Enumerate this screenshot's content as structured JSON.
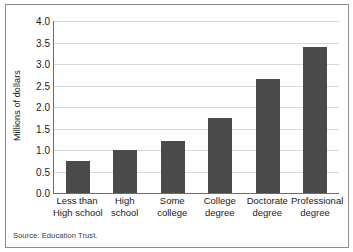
{
  "chart_data": {
    "type": "bar",
    "title": "",
    "xlabel": "",
    "ylabel": "Millions of dollars",
    "ylim": [
      0,
      4.0
    ],
    "ytick_step": 0.5,
    "grid": true,
    "legend": null,
    "categories": [
      "Less than High school",
      "High school",
      "Some college",
      "College degree",
      "Doctorate degree",
      "Professional degree"
    ],
    "category_lines": [
      [
        "Less than",
        "High school"
      ],
      [
        "High",
        "school"
      ],
      [
        "Some",
        "college"
      ],
      [
        "College",
        "degree"
      ],
      [
        "Doctorate",
        "degree"
      ],
      [
        "Professional",
        "degree"
      ]
    ],
    "values": [
      0.75,
      1.0,
      1.2,
      1.75,
      2.65,
      3.4
    ],
    "ytick_labels": [
      "4.0",
      "3.5",
      "3.0",
      "2.5",
      "2.0",
      "1.5",
      "1.0",
      "0.5",
      "0.0"
    ],
    "ytick_values": [
      4.0,
      3.5,
      3.0,
      2.5,
      2.0,
      1.5,
      1.0,
      0.5,
      0.0
    ],
    "bar_color": "#4a4a4a",
    "grid_color": "#d8d8d8",
    "axis_color": "#6d6d6d"
  },
  "footer": {
    "source": "Source: Education Trust."
  }
}
